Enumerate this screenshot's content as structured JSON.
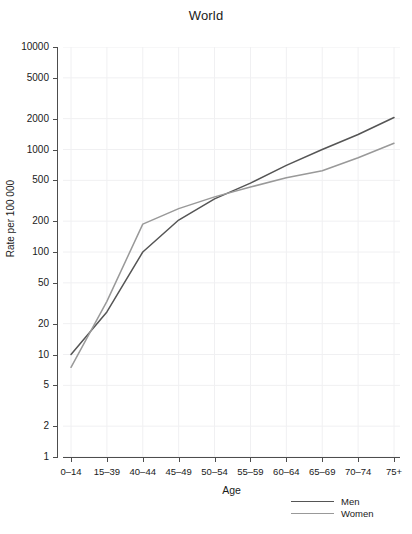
{
  "chart_data": {
    "type": "line",
    "title": "World",
    "xlabel": "Age",
    "ylabel": "Rate per 100 000",
    "yscale": "log",
    "ylim": [
      1,
      10000
    ],
    "grid": true,
    "legend_position": "bottom-right",
    "categories": [
      "0-14",
      "15-39",
      "40-44",
      "45-49",
      "50-54",
      "55-59",
      "60-64",
      "65-69",
      "70-74",
      "75+"
    ],
    "x_tick_labels": [
      "0–14",
      "15–39",
      "40–44",
      "45–49",
      "50–54",
      "55–59",
      "60–64",
      "65–69",
      "70–74",
      "75+"
    ],
    "y_tick_values": [
      1,
      2,
      5,
      10,
      20,
      50,
      100,
      200,
      500,
      1000,
      2000,
      5000,
      10000
    ],
    "y_tick_labels": [
      "1",
      "2",
      "5",
      "10",
      "20",
      "50",
      "100",
      "200",
      "500",
      "1000",
      "2000",
      "5000",
      "10000"
    ],
    "series": [
      {
        "name": "Men",
        "color": "#555555",
        "values": [
          10,
          26,
          100,
          205,
          330,
          470,
          700,
          1000,
          1400,
          2050
        ]
      },
      {
        "name": "Women",
        "color": "#999999",
        "values": [
          7.5,
          33,
          187,
          265,
          345,
          430,
          530,
          620,
          830,
          1150
        ]
      }
    ],
    "legend": [
      {
        "label": "Men",
        "color": "#555555"
      },
      {
        "label": "Women",
        "color": "#999999"
      }
    ],
    "style": {
      "grid_color": "#f0f0f2",
      "axis_color": "#4d4d4d",
      "background": "#ffffff"
    }
  }
}
